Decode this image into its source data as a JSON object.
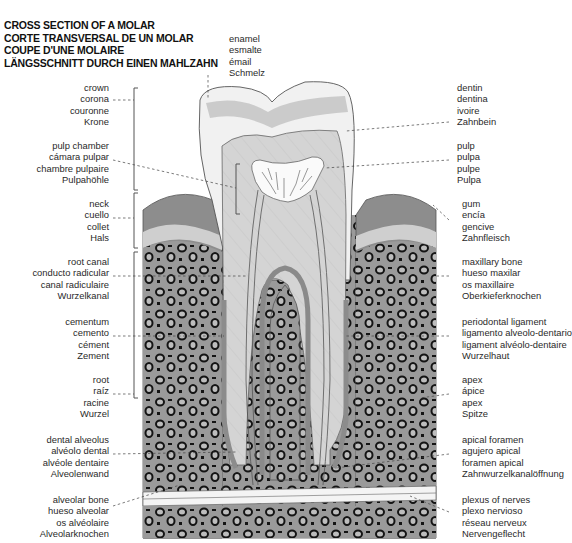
{
  "title": {
    "lines": [
      "CROSS SECTION OF A MOLAR",
      "CORTE TRANSVERSAL DE UN MOLAR",
      "COUPE D'UNE MOLAIRE",
      "LÄNGSSCHNITT DURCH EINEN MAHLZAHN"
    ]
  },
  "labels": {
    "enamel": [
      "enamel",
      "esmalte",
      "émail",
      "Schmelz"
    ],
    "crown": [
      "crown",
      "corona",
      "couronne",
      "Krone"
    ],
    "pulp_chamber": [
      "pulp chamber",
      "cámara pulpar",
      "chambre pulpaire",
      "Pulpahöhle"
    ],
    "neck": [
      "neck",
      "cuello",
      "collet",
      "Hals"
    ],
    "root_canal": [
      "root canal",
      "conducto radicular",
      "canal radiculaire",
      "Wurzelkanal"
    ],
    "cementum": [
      "cementum",
      "cemento",
      "cément",
      "Zement"
    ],
    "root": [
      "root",
      "raíz",
      "racine",
      "Wurzel"
    ],
    "dental_alveolus": [
      "dental alveolus",
      "alvéolo dental",
      "alvéole dentaire",
      "Alveolenwand"
    ],
    "alveolar_bone": [
      "alveolar bone",
      "hueso alveolar",
      "os alvéolaire",
      "Alveolarknochen"
    ],
    "dentin": [
      "dentin",
      "dentina",
      "ivoire",
      "Zahnbein"
    ],
    "pulp": [
      "pulp",
      "pulpa",
      "pulpe",
      "Pulpa"
    ],
    "gum": [
      "gum",
      "encía",
      "gencive",
      "Zahnfleisch"
    ],
    "maxillary_bone": [
      "maxillary bone",
      "hueso maxilar",
      "os maxillaire",
      "Oberkieferknochen"
    ],
    "periodontal_ligament": [
      "periodontal ligament",
      "ligamento alveolo-dentario",
      "ligament alvéolo-dentaire",
      "Wurzelhaut"
    ],
    "apex": [
      "apex",
      "ápice",
      "apex",
      "Spitze"
    ],
    "apical_foramen": [
      "apical foramen",
      "agujero apical",
      "foramen apical",
      "Zahnwurzelkanalöffnung"
    ],
    "plexus_of_nerves": [
      "plexus of nerves",
      "plexo nervioso",
      "réseau nerveux",
      "Nervengeflecht"
    ]
  },
  "colors": {
    "enamel": "#f2f2f2",
    "dentin": "#d6d6d6",
    "pulp": "#fafafa",
    "gum_dark": "#8a8a8a",
    "gum_light": "#c8c8c8",
    "bone": "#9a9a9a",
    "bone_spots": "#1a1a1a"
  }
}
